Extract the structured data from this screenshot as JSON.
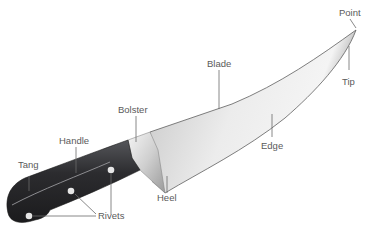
{
  "diagram": {
    "colors": {
      "blade_light": "#f2f2f2",
      "blade_dark": "#b4b4b4",
      "handle": "#2e2e30",
      "bolster": "#d8d8d8",
      "rivet": "#e6e6e6",
      "leader": "#6a6a6a",
      "label": "#5a5a5a"
    },
    "labels": {
      "point": "Point",
      "blade": "Blade",
      "tip": "Tip",
      "bolster": "Bolster",
      "edge": "Edge",
      "handle": "Handle",
      "heel": "Heel",
      "tang": "Tang",
      "rivets": "Rivets"
    }
  }
}
